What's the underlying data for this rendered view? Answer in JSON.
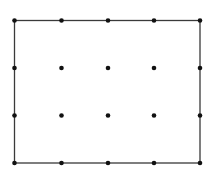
{
  "diagram": {
    "type": "dot-grid-rectangle",
    "columns": 5,
    "rows": 4,
    "x_positions": [
      14.5,
      61.5,
      108,
      154,
      200
    ],
    "y_positions": [
      20.5,
      68,
      115.5,
      163
    ],
    "border": {
      "x": 14.5,
      "y": 20.5,
      "width": 185.5,
      "height": 142.5,
      "stroke": "#3a3a3a",
      "stroke_width": 1.3
    },
    "dot": {
      "radius": 2.3,
      "fill": "#111111"
    }
  }
}
